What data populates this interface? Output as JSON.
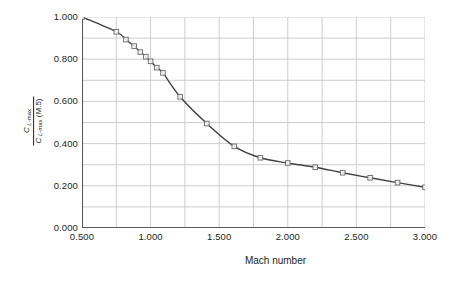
{
  "chart_data": {
    "type": "line",
    "title": "",
    "subtitle": "",
    "xlabel": "Mach number",
    "ylabel_numerator": "C L-max",
    "ylabel_denominator": "C L-max (M.5)",
    "ylabel": "C_L-max / C_L-max (M.5)",
    "xlim": [
      0.5,
      3.0
    ],
    "ylim": [
      0.0,
      1.0
    ],
    "x_ticks": [
      0.5,
      1.0,
      1.5,
      2.0,
      2.5,
      3.0
    ],
    "x_tick_labels": [
      "0.500",
      "1.000",
      "1.500",
      "2.000",
      "2.500",
      "3.000"
    ],
    "y_ticks": [
      0.0,
      0.2,
      0.4,
      0.6,
      0.8,
      1.0
    ],
    "y_tick_labels": [
      "0.000",
      "0.200",
      "0.400",
      "0.600",
      "0.800",
      "1.000"
    ],
    "x_gridline_step": 0.25,
    "y_gridline_step": 0.1,
    "grid": true,
    "legend": false,
    "legend_position": "none",
    "marker": "open-square",
    "line_color": "#3f3f41",
    "grid_color": "#c8c8c8",
    "axis_color": "#58595b",
    "marker_edge_color": "#6d6e71",
    "marker_face_color": "#ffffff",
    "series": [
      {
        "name": "CL-max ratio",
        "x": [
          0.5,
          0.75,
          0.82,
          0.88,
          0.92,
          0.96,
          1.0,
          1.06,
          1.2,
          1.4,
          1.6,
          1.8,
          2.0,
          2.2,
          2.4,
          2.6,
          2.8,
          3.0
        ],
        "y": [
          1.0,
          0.93,
          0.893,
          0.862,
          0.834,
          0.812,
          0.79,
          0.76,
          0.735,
          0.622,
          0.495,
          0.387,
          0.333,
          0.308,
          0.287,
          0.262,
          0.238,
          0.215
        ],
        "values": [
          1.0,
          0.93,
          0.893,
          0.862,
          0.834,
          0.812,
          0.79,
          0.76,
          0.735,
          0.622,
          0.495,
          0.387,
          0.333,
          0.308,
          0.287,
          0.262,
          0.238,
          0.215
        ]
      }
    ],
    "points": [
      {
        "x": 0.5,
        "y": 1.0
      },
      {
        "x": 0.75,
        "y": 0.93
      },
      {
        "x": 0.82,
        "y": 0.893
      },
      {
        "x": 0.88,
        "y": 0.862
      },
      {
        "x": 0.925,
        "y": 0.834
      },
      {
        "x": 0.965,
        "y": 0.812
      },
      {
        "x": 1.0,
        "y": 0.79
      },
      {
        "x": 1.045,
        "y": 0.76
      },
      {
        "x": 1.09,
        "y": 0.735
      },
      {
        "x": 1.215,
        "y": 0.622
      },
      {
        "x": 1.41,
        "y": 0.495
      },
      {
        "x": 1.61,
        "y": 0.387
      },
      {
        "x": 1.8,
        "y": 0.333
      },
      {
        "x": 2.0,
        "y": 0.308
      },
      {
        "x": 2.2,
        "y": 0.288
      },
      {
        "x": 2.4,
        "y": 0.262
      },
      {
        "x": 2.6,
        "y": 0.238
      },
      {
        "x": 2.8,
        "y": 0.215
      },
      {
        "x": 3.0,
        "y": 0.193
      }
    ]
  }
}
